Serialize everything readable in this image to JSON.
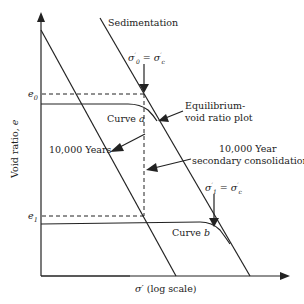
{
  "diagram": {
    "axes": {
      "x_label": "σ′ (log scale)",
      "y_label": "Void ratio, e",
      "y_ticks": [
        {
          "label": "e",
          "sub": "0"
        },
        {
          "label": "e",
          "sub": "1"
        }
      ]
    },
    "labels": {
      "sedimentation": "Sedimentation",
      "sigma0_eq": "σ′₀ = σ′c",
      "sigma1_eq": "σ′₁ = σ′c",
      "curve_a": "Curve a",
      "curve_b": "Curve b",
      "equilibrium_line1": "Equilibrium-",
      "equilibrium_line2": "void ratio plot",
      "ten_thousand_years": "10,000 Years",
      "secondary_line1": "10,000 Year",
      "secondary_line2": "secondary consolidation"
    },
    "colors": {
      "line": "#222222",
      "background": "#ffffff"
    }
  }
}
